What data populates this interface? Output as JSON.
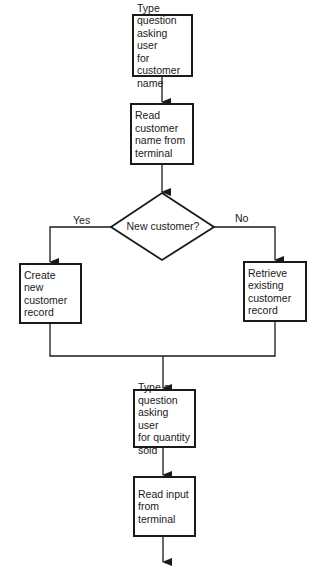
{
  "flowchart": {
    "nodes": [
      {
        "id": "ask-name",
        "type": "process",
        "text": "Type\nquestion\nasking user\nfor customer\nname"
      },
      {
        "id": "read-name",
        "type": "process",
        "text": "Read\ncustomer\nname from\nterminal"
      },
      {
        "id": "new-customer",
        "type": "decision",
        "text": "New customer?"
      },
      {
        "id": "create-record",
        "type": "process",
        "text": "Create new\ncustomer\nrecord"
      },
      {
        "id": "retrieve-record",
        "type": "process",
        "text": "Retrieve\nexisting\ncustomer\nrecord"
      },
      {
        "id": "ask-quantity",
        "type": "process",
        "text": "Type a\nquestion\nasking user\nfor quantity\nsold"
      },
      {
        "id": "read-input",
        "type": "process",
        "text": "Read input\nfrom\nterminal"
      }
    ],
    "branch_labels": {
      "yes": "Yes",
      "no": "No"
    },
    "colors": {
      "line": "#1a1a1a",
      "background": "#ffffff"
    }
  }
}
